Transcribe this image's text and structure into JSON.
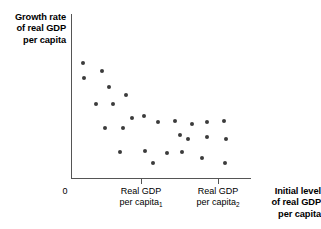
{
  "chart_data": {
    "type": "scatter",
    "title": "",
    "ylabel": "Growth rate of real GDP per capita",
    "xlabel": "Initial level of real GDP per capita",
    "ylabel_lines": [
      "Growth rate",
      "of real GDP",
      "per capita"
    ],
    "xlabel_lines": [
      "Initial level",
      "of real GDP",
      "per capita"
    ],
    "origin_label": "0",
    "grid": false,
    "legend": null,
    "xtick_labels": [
      {
        "line1": "Real GDP",
        "line2": "per capita",
        "subscript": "1",
        "px": 141
      },
      {
        "line1": "Real GDP",
        "line2": "per capita",
        "subscript": "2",
        "px": 218
      }
    ],
    "xlim": [
      0,
      1
    ],
    "ylim": [
      0,
      1
    ],
    "axis_pixels": {
      "x0": 71,
      "x1": 251,
      "y0": 14,
      "y1": 178
    },
    "points": [
      {
        "x": 83,
        "y": 63
      },
      {
        "x": 84,
        "y": 78
      },
      {
        "x": 102,
        "y": 71
      },
      {
        "x": 109,
        "y": 87
      },
      {
        "x": 126,
        "y": 95
      },
      {
        "x": 96,
        "y": 104
      },
      {
        "x": 144,
        "y": 116
      },
      {
        "x": 105,
        "y": 128
      },
      {
        "x": 123,
        "y": 128
      },
      {
        "x": 158,
        "y": 122
      },
      {
        "x": 175,
        "y": 121
      },
      {
        "x": 180,
        "y": 135
      },
      {
        "x": 192,
        "y": 124
      },
      {
        "x": 207,
        "y": 122
      },
      {
        "x": 207,
        "y": 137
      },
      {
        "x": 224,
        "y": 121
      },
      {
        "x": 226,
        "y": 139
      },
      {
        "x": 188,
        "y": 139
      },
      {
        "x": 120,
        "y": 152
      },
      {
        "x": 145,
        "y": 151
      },
      {
        "x": 167,
        "y": 153
      },
      {
        "x": 182,
        "y": 152
      },
      {
        "x": 153,
        "y": 163
      },
      {
        "x": 202,
        "y": 158
      },
      {
        "x": 225,
        "y": 163
      },
      {
        "x": 132,
        "y": 118
      },
      {
        "x": 113,
        "y": 104
      }
    ]
  }
}
